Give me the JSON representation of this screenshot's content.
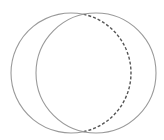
{
  "diagram": {
    "type": "two-overlapping-circles",
    "colors": {
      "background": "#ffffff",
      "solid_stroke": "#9a9a9a",
      "dashed_stroke": "#555555"
    },
    "circles": [
      {
        "name": "left-circle",
        "cx": 71,
        "cy": 73,
        "r": 60
      },
      {
        "name": "right-circle",
        "cx": 96,
        "cy": 73,
        "r": 60
      }
    ],
    "intersections": [
      {
        "x": 83.5,
        "y": 14.3
      },
      {
        "x": 83.5,
        "y": 131.7
      }
    ],
    "dashed_arc": {
      "of": "left-circle",
      "side": "right",
      "dasharray": "3 2"
    }
  }
}
